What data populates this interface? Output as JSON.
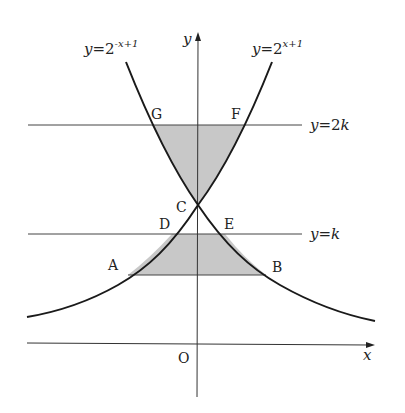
{
  "diagram": {
    "curves": [
      {
        "id": "left",
        "label_y": "y",
        "label_eq": "=2",
        "label_exp": "-x+1"
      },
      {
        "id": "right",
        "label_y": "y",
        "label_eq": "=2",
        "label_exp": "x+1"
      }
    ],
    "lines": [
      {
        "id": "y2k",
        "label_y": "y",
        "label_eq": "=2",
        "label_k": "k"
      },
      {
        "id": "yk",
        "label_y": "y",
        "label_eq": "=",
        "label_k": "k"
      }
    ],
    "axes": {
      "x_label": "x",
      "y_label": "y",
      "origin_label": "O"
    },
    "points": {
      "A": "A",
      "B": "B",
      "C": "C",
      "D": "D",
      "E": "E",
      "F": "F",
      "G": "G"
    },
    "colors": {
      "shade": "#c8c8c8",
      "stroke": "#1a1a1a",
      "axis": "#333333"
    }
  }
}
